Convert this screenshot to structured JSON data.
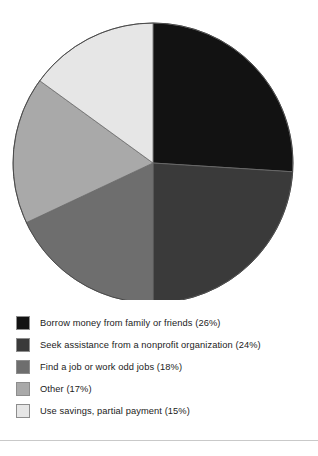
{
  "chart_data": {
    "type": "pie",
    "title": "",
    "subtitle": "",
    "xlabel": "",
    "ylabel": "",
    "legend_position": "bottom",
    "grid": false,
    "start_angle_deg": 0,
    "direction": "clockwise",
    "categories": [
      "Borrow money from family or friends",
      "Seek assistance from a nonprofit organization",
      "Find a job or work odd jobs",
      "Other",
      "Use savings, partial payment"
    ],
    "values": [
      26,
      24,
      18,
      17,
      15
    ],
    "value_unit": "%",
    "colors": [
      "#121212",
      "#3a3a3a",
      "#6e6e6e",
      "#a9a9a9",
      "#e6e6e6"
    ],
    "slices": [
      {
        "label": "Borrow money from family or friends",
        "value": 26,
        "legend_text": "Borrow money from family or friends (26%)",
        "color": "#121212"
      },
      {
        "label": "Seek assistance from a nonprofit organization",
        "value": 24,
        "legend_text": "Seek assistance from a nonprofit organization (24%)",
        "color": "#3a3a3a"
      },
      {
        "label": "Find a job or work odd jobs",
        "value": 18,
        "legend_text": "Find a job or work odd jobs (18%)",
        "color": "#6e6e6e"
      },
      {
        "label": "Other",
        "value": 17,
        "legend_text": "Other (17%)",
        "color": "#a9a9a9"
      },
      {
        "label": "Use savings, partial payment",
        "value": 15,
        "legend_text": "Use savings, partial payment (15%)",
        "color": "#e6e6e6"
      }
    ]
  },
  "legend": {
    "items": [
      {
        "text": "Borrow money from family or friends (26%)"
      },
      {
        "text": "Seek assistance from a nonprofit organization (24%)"
      },
      {
        "text": "Find a job or work odd jobs (18%)"
      },
      {
        "text": "Other (17%)"
      },
      {
        "text": "Use savings, partial payment (15%)"
      }
    ]
  }
}
